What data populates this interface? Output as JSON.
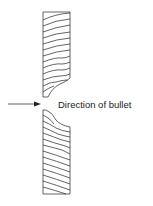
{
  "diagram": {
    "label": "Direction of bullet",
    "elements": [
      "upper-wood-block",
      "lower-wood-block",
      "arrow"
    ],
    "stroke_color": "#222222"
  }
}
